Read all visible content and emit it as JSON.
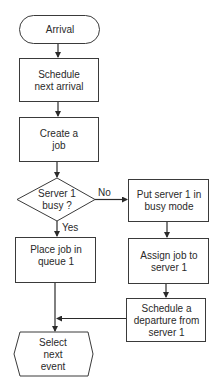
{
  "diagram": {
    "type": "flowchart",
    "nodes": [
      {
        "id": "arrival",
        "shape": "terminator",
        "label": "Arrival"
      },
      {
        "id": "schedule_next",
        "shape": "process",
        "label": "Schedule next arrival"
      },
      {
        "id": "create_job",
        "shape": "process",
        "label": "Create a job"
      },
      {
        "id": "server_busy",
        "shape": "decision",
        "label": "Server 1 busy ?"
      },
      {
        "id": "put_busy",
        "shape": "process",
        "label": "Put server 1 in busy mode"
      },
      {
        "id": "place_queue",
        "shape": "process",
        "label": "Place job in queue 1"
      },
      {
        "id": "assign_job",
        "shape": "process",
        "label": "Assign job to server 1"
      },
      {
        "id": "schedule_departure",
        "shape": "process",
        "label": "Schedule a departure from server 1"
      },
      {
        "id": "select_next",
        "shape": "hexagon",
        "label": "Select next event"
      }
    ],
    "edges": [
      {
        "from": "arrival",
        "to": "schedule_next",
        "label": ""
      },
      {
        "from": "schedule_next",
        "to": "create_job",
        "label": ""
      },
      {
        "from": "create_job",
        "to": "server_busy",
        "label": ""
      },
      {
        "from": "server_busy",
        "to": "put_busy",
        "label": "No"
      },
      {
        "from": "server_busy",
        "to": "place_queue",
        "label": "Yes"
      },
      {
        "from": "put_busy",
        "to": "assign_job",
        "label": ""
      },
      {
        "from": "assign_job",
        "to": "schedule_departure",
        "label": ""
      },
      {
        "from": "place_queue",
        "to": "select_next",
        "label": ""
      },
      {
        "from": "schedule_departure",
        "to": "select_next",
        "label": ""
      }
    ],
    "edge_labels": {
      "no": "No",
      "yes": "Yes"
    }
  }
}
